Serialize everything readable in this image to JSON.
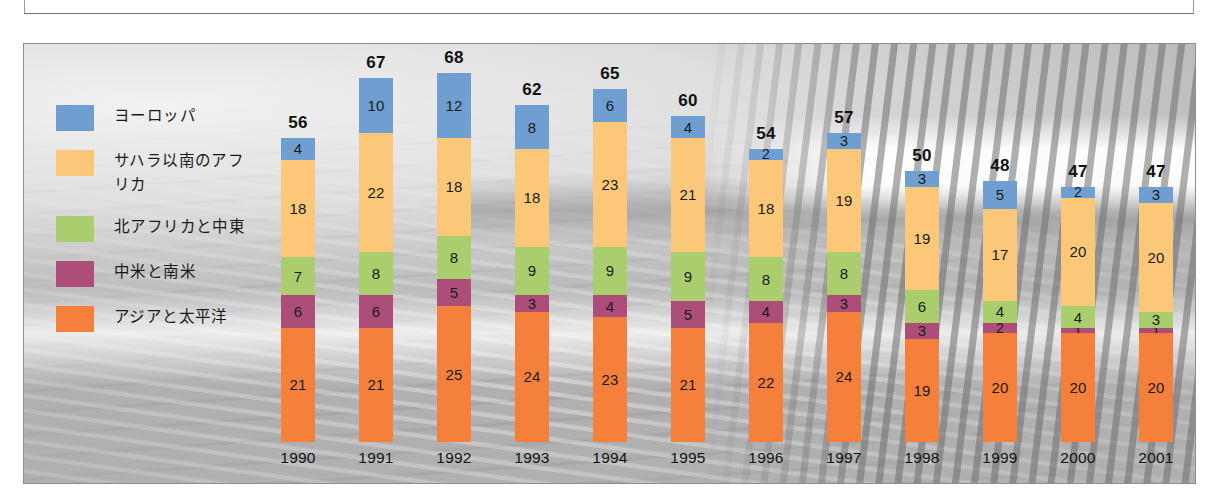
{
  "legend": {
    "items": [
      {
        "label": "ヨーロッパ",
        "color": "#6f9fd0"
      },
      {
        "label": "サハラ以南のアフ\nリカ",
        "color": "#fbc87a"
      },
      {
        "label": "北アフリカと中東",
        "color": "#aacd6e"
      },
      {
        "label": "中米と南米",
        "color": "#ad4e79"
      },
      {
        "label": "アジアと太平洋",
        "color": "#f4803c"
      }
    ]
  },
  "chart_data": {
    "type": "bar",
    "stacked": true,
    "title": "",
    "subtitle": "",
    "xlabel": "",
    "ylabel": "",
    "grid": false,
    "legend_position": "left",
    "categories": [
      "1990",
      "1991",
      "1992",
      "1993",
      "1994",
      "1995",
      "1996",
      "1997",
      "1998",
      "1999",
      "2000",
      "2001"
    ],
    "series": [
      {
        "name": "ヨーロッパ",
        "color": "#6f9fd0",
        "values": [
          4,
          10,
          12,
          8,
          6,
          4,
          2,
          3,
          3,
          5,
          2,
          3
        ]
      },
      {
        "name": "サハラ以南のアフリカ",
        "color": "#fbc87a",
        "values": [
          18,
          22,
          18,
          18,
          23,
          21,
          18,
          19,
          19,
          17,
          20,
          20
        ]
      },
      {
        "name": "北アフリカと中東",
        "color": "#aacd6e",
        "values": [
          7,
          8,
          8,
          9,
          9,
          9,
          8,
          8,
          6,
          4,
          4,
          3
        ]
      },
      {
        "name": "中米と南米",
        "color": "#ad4e79",
        "values": [
          6,
          6,
          5,
          3,
          4,
          5,
          4,
          3,
          3,
          2,
          1,
          1
        ]
      },
      {
        "name": "アジアと太平洋",
        "color": "#f4803c",
        "values": [
          21,
          21,
          25,
          24,
          23,
          21,
          22,
          24,
          19,
          20,
          20,
          20
        ]
      }
    ],
    "totals": [
      56,
      67,
      68,
      62,
      65,
      60,
      54,
      57,
      50,
      48,
      47,
      47
    ],
    "ylim": [
      0,
      68
    ]
  },
  "layout": {
    "px_per_unit": 5.43,
    "bar_width": 34,
    "first_bar_left": 257,
    "bar_pitch": 78
  }
}
